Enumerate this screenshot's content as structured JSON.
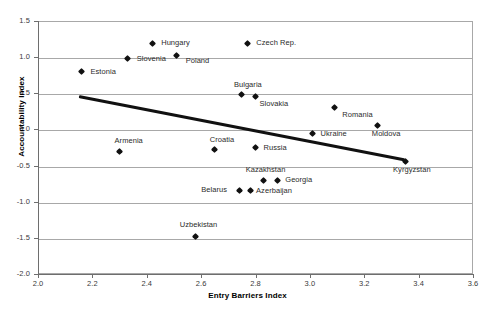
{
  "chart_data": {
    "type": "scatter",
    "title": "",
    "xlabel": "Entry Barriers Index",
    "ylabel": "Accountability Index",
    "xlim": [
      2.0,
      3.6
    ],
    "ylim": [
      -2.0,
      1.5
    ],
    "xticks": [
      "2.0",
      "2.2",
      "2.4",
      "2.6",
      "2.8",
      "3.0",
      "3.2",
      "3.4",
      "3.6"
    ],
    "yticks": [
      "1.5",
      "1.0",
      "0.5",
      "0.0",
      "-0.5",
      "-1.0",
      "-1.5",
      "-2.0"
    ],
    "grid": true,
    "legend": "none",
    "marker_color": "#111111",
    "trendline": {
      "label": "linear fit",
      "color": "#111111",
      "x0": 2.15,
      "y0": 0.45,
      "x1": 3.35,
      "y1": -0.43
    },
    "points": [
      {
        "label": "Estonia",
        "x": 2.16,
        "y": 0.8,
        "lx": 9,
        "ly": -3
      },
      {
        "label": "Slovenia",
        "x": 2.33,
        "y": 0.98,
        "lx": 9,
        "ly": -3
      },
      {
        "label": "Hungary",
        "x": 2.42,
        "y": 1.19,
        "lx": 9,
        "ly": -3
      },
      {
        "label": "Poland",
        "x": 2.51,
        "y": 1.02,
        "lx": 9,
        "ly": 2
      },
      {
        "label": "Czech Rep.",
        "x": 2.77,
        "y": 1.19,
        "lx": 9,
        "ly": -3
      },
      {
        "label": "Bulgaria",
        "x": 2.75,
        "y": 0.48,
        "lx": -8,
        "ly": -13
      },
      {
        "label": "Slovakia",
        "x": 2.8,
        "y": 0.45,
        "lx": 4,
        "ly": 4
      },
      {
        "label": "Romania",
        "x": 3.09,
        "y": 0.3,
        "lx": 8,
        "ly": 4
      },
      {
        "label": "Ukraine",
        "x": 3.01,
        "y": -0.06,
        "lx": 8,
        "ly": -3
      },
      {
        "label": "Moldova",
        "x": 3.25,
        "y": 0.05,
        "lx": -6,
        "ly": 5
      },
      {
        "label": "Armenia",
        "x": 2.3,
        "y": -0.3,
        "lx": -5,
        "ly": -13
      },
      {
        "label": "Croatia",
        "x": 2.65,
        "y": -0.28,
        "lx": -5,
        "ly": -13
      },
      {
        "label": "Russia",
        "x": 2.8,
        "y": -0.25,
        "lx": 8,
        "ly": -3
      },
      {
        "label": "Kazakhstan",
        "x": 2.83,
        "y": -0.7,
        "lx": -18,
        "ly": -13
      },
      {
        "label": "Georgia",
        "x": 2.88,
        "y": -0.7,
        "lx": 8,
        "ly": -3
      },
      {
        "label": "Belarus",
        "x": 2.74,
        "y": -0.84,
        "lx": -38,
        "ly": -3
      },
      {
        "label": "Azerbaijan",
        "x": 2.78,
        "y": -0.84,
        "lx": 6,
        "ly": -2
      },
      {
        "label": "Uzbekistan",
        "x": 2.58,
        "y": -1.48,
        "lx": -16,
        "ly": -14
      },
      {
        "label": "Kyrgyzstan",
        "x": 3.35,
        "y": -0.44,
        "lx": -12,
        "ly": 6
      }
    ]
  }
}
